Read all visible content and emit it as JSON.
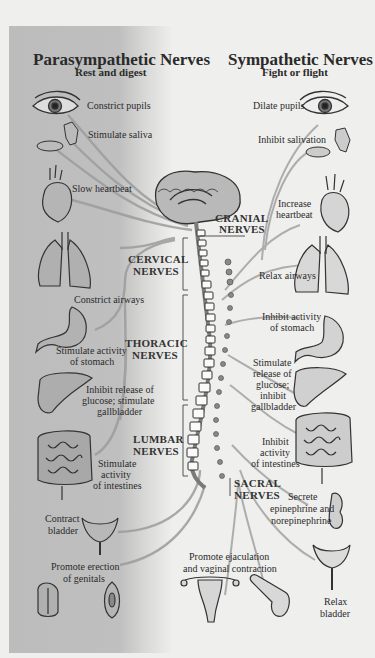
{
  "parasympathetic": {
    "title": "Parasympathetic Nerves",
    "subtitle": "Rest and digest",
    "effects": {
      "eye": "Constrict pupils",
      "saliva": "Stimulate saliva",
      "heart": "Slow heartbeat",
      "lungs": "Constrict airways",
      "stomach_1": "Stimulate activity",
      "stomach_2": "of stomach",
      "liver_1": "Inhibit release of",
      "liver_2": "glucose; stimulate",
      "liver_3": "gallbladder",
      "intestines_1": "Stimulate",
      "intestines_2": "activity",
      "intestines_3": "of intestines",
      "bladder_1": "Contract",
      "bladder_2": "bladder",
      "genitals_1": "Promote erection",
      "genitals_2": "of genitals"
    }
  },
  "sympathetic": {
    "title": "Sympathetic Nerves",
    "subtitle": "Fight or flight",
    "effects": {
      "eye": "Dilate pupils",
      "saliva": "Inhibit salivation",
      "heart_1": "Increase",
      "heart_2": "heartbeat",
      "lungs": "Relax airways",
      "stomach_1": "Inhibit activity",
      "stomach_2": "of stomach",
      "liver_1": "Stimulate",
      "liver_2": "release of",
      "liver_3": "glucose;",
      "liver_4": "inhibit",
      "liver_5": "gallbladder",
      "intestines_1": "Inhibit",
      "intestines_2": "activity",
      "intestines_3": "of intestines",
      "adrenal_1": "Secrete",
      "adrenal_2": "epinephrine and",
      "adrenal_3": "norepinephrine",
      "genitals_1": "Promote ejaculation",
      "genitals_2": "and vaginal contraction",
      "bladder_1": "Relax",
      "bladder_2": "bladder"
    }
  },
  "regions": {
    "cranial_1": "CRANIAL",
    "cranial_2": "NERVES",
    "cervical_1": "CERVICAL",
    "cervical_2": "NERVES",
    "thoracic_1": "THORACIC",
    "thoracic_2": "NERVES",
    "lumbar_1": "LUMBAR",
    "lumbar_2": "NERVES",
    "sacral_1": "SACRAL",
    "sacral_2": "NERVES"
  },
  "colors": {
    "panel": "#bdbdbd",
    "background": "#efefed",
    "nerve_line": "#9a9a9a",
    "ink": "#2a2a2a"
  }
}
